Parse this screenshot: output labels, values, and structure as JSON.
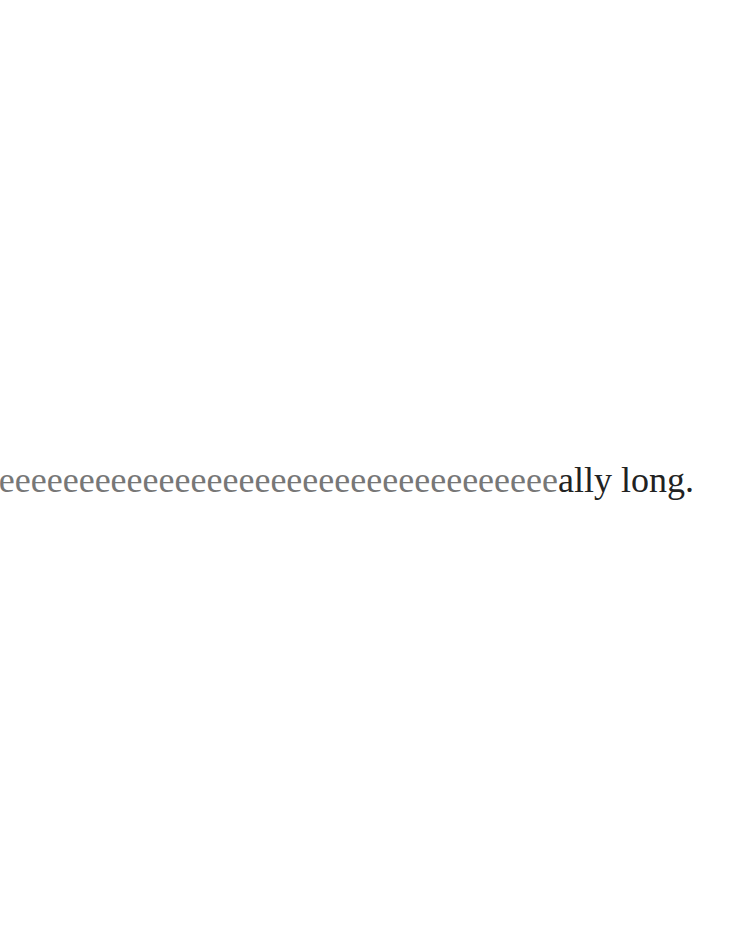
{
  "document": {
    "text_faded": "Reeeeeeeeeeeeeeeeeeeeeeeeeeeeeeeeeeeeee",
    "text_solid": "ally long.",
    "colors": {
      "background": "#ffffff",
      "faded_text": "#777777",
      "solid_text": "#222222"
    }
  }
}
